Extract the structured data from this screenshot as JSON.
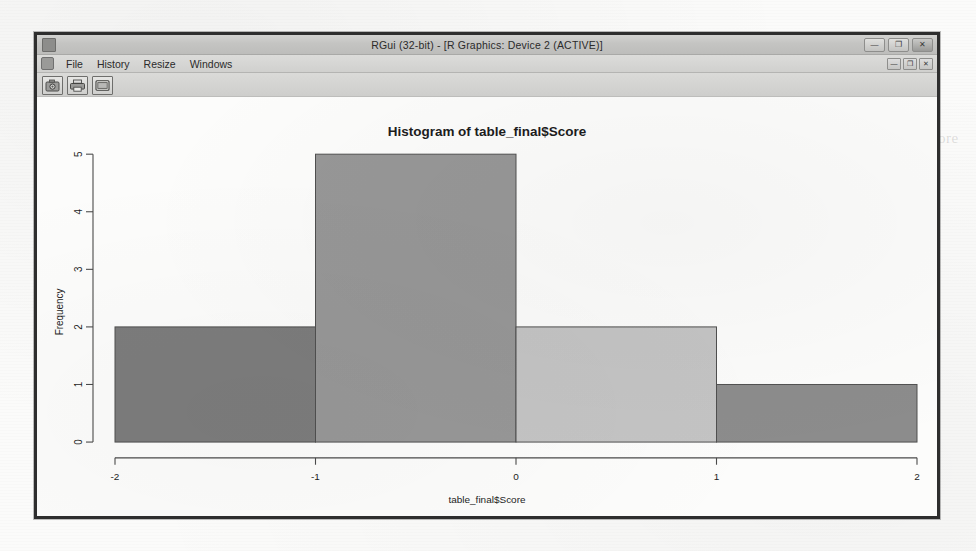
{
  "page": {
    "background_color": "#fbfbfa",
    "ghost_text": [
      {
        "text": "will be performed. This will be performed by collecting the score from",
        "x": 470,
        "y": 104
      },
      {
        "text": "sub-scale normalized. For the purpose of standard of living negative score",
        "x": 470,
        "y": 130
      },
      {
        "text": "indicates will be negative and positive score will be positive",
        "x": 470,
        "y": 156
      },
      {
        "text": "been found. So we can conclude that the",
        "x": 470,
        "y": 182
      },
      {
        "text": "score = Σ ( z-score 1 ... z-score n )",
        "x": 470,
        "y": 236
      },
      {
        "text": "where n is the number of indicator parameters included in the index.",
        "x": 470,
        "y": 290
      },
      {
        "text": "The average composite score is then used to rank the",
        "x": 470,
        "y": 316
      },
      {
        "text": "households within a given sample.",
        "x": 470,
        "y": 342
      }
    ]
  },
  "window": {
    "title": "RGui (32-bit) - [R Graphics: Device 2 (ACTIVE)]",
    "app_icon": "r-app-icon",
    "controls": [
      {
        "name": "minimize-button",
        "glyph": "—"
      },
      {
        "name": "restore-button",
        "glyph": "❐"
      },
      {
        "name": "close-button",
        "glyph": "✕"
      }
    ],
    "mdi_controls": [
      {
        "name": "mdi-minimize-button",
        "glyph": "—"
      },
      {
        "name": "mdi-restore-button",
        "glyph": "❐"
      },
      {
        "name": "mdi-close-button",
        "glyph": "✕"
      }
    ],
    "menu": [
      {
        "name": "menu-file",
        "label": "File"
      },
      {
        "name": "menu-history",
        "label": "History"
      },
      {
        "name": "menu-resize",
        "label": "Resize"
      },
      {
        "name": "menu-windows",
        "label": "Windows"
      }
    ],
    "toolbar": [
      {
        "name": "copy-to-clipboard-button",
        "icon": "camera-icon"
      },
      {
        "name": "print-button",
        "icon": "printer-icon"
      },
      {
        "name": "new-window-button",
        "icon": "window-icon"
      }
    ]
  },
  "chart_data": {
    "type": "bar",
    "title": "Histogram of table_final$Score",
    "xlabel": "table_final$Score",
    "ylabel": "Frequency",
    "xlim": [
      -2,
      2
    ],
    "ylim": [
      0,
      5
    ],
    "xticks": [
      -2,
      -1,
      0,
      1,
      2
    ],
    "xtick_labels": [
      "-2",
      "-1",
      "0",
      "1",
      "2"
    ],
    "yticks": [
      0,
      1,
      2,
      3,
      4,
      5
    ],
    "ytick_labels": [
      "0",
      "1",
      "2",
      "3",
      "4",
      "5"
    ],
    "grid": false,
    "legend": false,
    "bin_edges": [
      -2,
      -1,
      0,
      1,
      2
    ],
    "bin_width": 1,
    "categories": [
      "[-2,-1)",
      "[-1,0)",
      "[0,1)",
      "[1,2]"
    ],
    "values": [
      2,
      5,
      2,
      1
    ],
    "bar_colors": [
      "#7c7c7c",
      "#979797",
      "#c4c4c4",
      "#8c8c8c"
    ],
    "bar_border_color": "#4f4f4f"
  }
}
